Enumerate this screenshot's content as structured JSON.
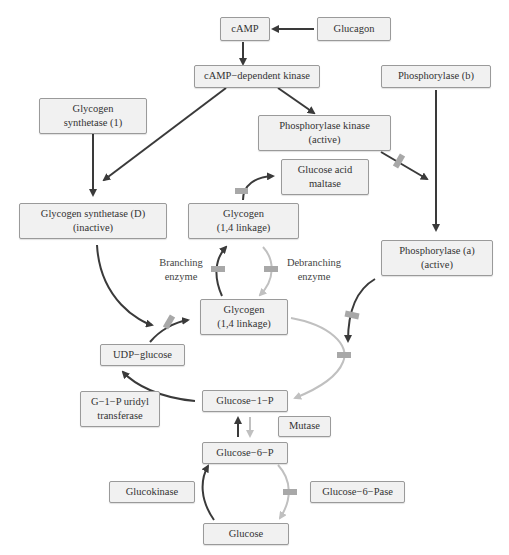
{
  "diagram": {
    "colors": {
      "node_fill": "#f1f1f1",
      "node_border": "#9a9a9a",
      "dark_arrow": "#3a3a3a",
      "light_arrow": "#c0c0c0",
      "blocker": "#a8a8a8",
      "text": "#333333"
    },
    "nodes": {
      "camp": {
        "line1": "cAMP",
        "line2": ""
      },
      "glucagon": {
        "line1": "Glucagon",
        "line2": ""
      },
      "camp_kinase": {
        "line1": "cAMP−dependent kinase",
        "line2": ""
      },
      "phosphorylase_b": {
        "line1": "Phosphorylase (b)",
        "line2": ""
      },
      "glycogen_synthetase_1": {
        "line1": "Glycogen",
        "line2": "synthetase (1)"
      },
      "phosphorylase_kinase": {
        "line1": "Phosphorylase kinase",
        "line2": "(active)"
      },
      "glucose_acid_maltase": {
        "line1": "Glucose acid",
        "line2": "maltase"
      },
      "glycogen_synthetase_d": {
        "line1": "Glycogen synthetase (D)",
        "line2": "(inactive)"
      },
      "glycogen_top": {
        "line1": "Glycogen",
        "line2": "(1,4 linkage)"
      },
      "phosphorylase_a": {
        "line1": "Phosphorylase (a)",
        "line2": "(active)"
      },
      "glycogen_mid": {
        "line1": "Glycogen",
        "line2": "(1,4 linkage)"
      },
      "udp_glucose": {
        "line1": "UDP−glucose",
        "line2": ""
      },
      "g1p_uridyl_transferase": {
        "line1": "G−1−P uridyl",
        "line2": "transferase"
      },
      "glucose_1_p": {
        "line1": "Glucose−1−P",
        "line2": ""
      },
      "mutase": {
        "line1": "Mutase",
        "line2": ""
      },
      "glucose_6_p": {
        "line1": "Glucose−6−P",
        "line2": ""
      },
      "glucokinase": {
        "line1": "Glucokinase",
        "line2": ""
      },
      "glucose_6_pase": {
        "line1": "Glucose−6−Pase",
        "line2": ""
      },
      "glucose": {
        "line1": "Glucose",
        "line2": ""
      }
    },
    "labels": {
      "branching": {
        "line1": "Branching",
        "line2": "enzyme"
      },
      "debranching": {
        "line1": "Debranching",
        "line2": "enzyme"
      }
    },
    "edges": [
      {
        "from": "Glucagon",
        "to": "cAMP",
        "style": "dark"
      },
      {
        "from": "cAMP",
        "to": "cAMP−dependent kinase",
        "style": "dark"
      },
      {
        "from": "cAMP−dependent kinase",
        "to": "Glycogen synthetase (D)",
        "style": "dark"
      },
      {
        "from": "cAMP−dependent kinase",
        "to": "Phosphorylase kinase (active)",
        "style": "dark"
      },
      {
        "from": "Glycogen synthetase (1)",
        "to": "Glycogen synthetase (D)",
        "style": "dark"
      },
      {
        "from": "Phosphorylase kinase (active)",
        "to": "Phosphorylase (a)",
        "style": "dark",
        "blocked": true
      },
      {
        "from": "Phosphorylase (b)",
        "to": "Phosphorylase (a)",
        "style": "dark"
      },
      {
        "from": "Glycogen (top)",
        "to": "Glucose acid maltase",
        "style": "dark",
        "blocked": true
      },
      {
        "from": "Glycogen (mid)",
        "to": "Glycogen (top)",
        "style": "dark",
        "via": "Branching enzyme",
        "blocked": true
      },
      {
        "from": "Glycogen (top)",
        "to": "Glycogen (mid)",
        "style": "light",
        "via": "Debranching enzyme",
        "blocked": true
      },
      {
        "from": "Glycogen synthetase (D)",
        "to": "Glycogen (mid)",
        "style": "dark"
      },
      {
        "from": "UDP−glucose",
        "to": "Glycogen (mid)",
        "style": "dark",
        "blocked": true
      },
      {
        "from": "Phosphorylase (a)",
        "to": "Glycogen→Glucose−1−P path",
        "style": "dark",
        "blocked": true
      },
      {
        "from": "Glycogen (mid)",
        "to": "Glucose−1−P",
        "style": "light",
        "blocked": true
      },
      {
        "from": "Glucose−1−P",
        "to": "UDP−glucose",
        "style": "dark"
      },
      {
        "from": "Glucose−6−P",
        "to": "Glucose−1−P",
        "style": "dark"
      },
      {
        "from": "Glucose−1−P",
        "to": "Glucose−6−P",
        "style": "light"
      },
      {
        "from": "Glucose",
        "to": "Glucose−6−P",
        "style": "dark"
      },
      {
        "from": "Glucose−6−P",
        "to": "Glucose",
        "style": "light",
        "blocked": true
      }
    ]
  }
}
